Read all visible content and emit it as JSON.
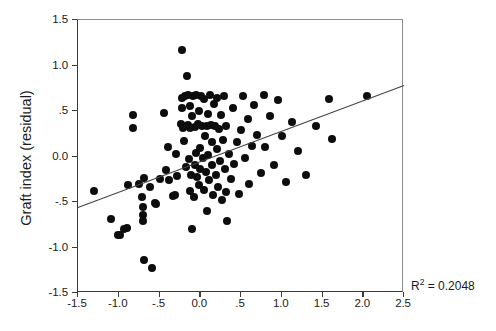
{
  "chart_data": {
    "type": "scatter",
    "title": "",
    "xlabel": "",
    "ylabel": "Graft index (residual)",
    "xlim": [
      -1.5,
      2.5
    ],
    "ylim": [
      -1.5,
      1.5
    ],
    "grid": false,
    "legend": null,
    "xticks": [
      -1.5,
      -1.0,
      -0.5,
      0.0,
      0.5,
      1.0,
      1.5,
      2.0,
      2.5
    ],
    "xticklabels": [
      "-1.5",
      "-1.0",
      "-.5",
      "0.0",
      ".5",
      "1.0",
      "1.5",
      "2.0",
      "2.5"
    ],
    "yticks": [
      -1.5,
      -1.0,
      -0.5,
      0.0,
      0.5,
      1.0,
      1.5
    ],
    "yticklabels": [
      "-1.5",
      "-1.0",
      "-.5",
      "0.0",
      ".5",
      "1.0",
      "1.5"
    ],
    "annotations": [
      {
        "name": "r-squared",
        "text": "R2 = 0.2048",
        "value": 0.2048,
        "position": "bottom-right-outside"
      }
    ],
    "fit_line": {
      "kind": "linear-regression",
      "x0": -1.5,
      "y0": -0.56,
      "x1": 2.5,
      "y1": 0.78,
      "slope": 0.335,
      "intercept": -0.0575,
      "r_squared": 0.2048,
      "color": "#444444"
    },
    "marker": {
      "shape": "circle",
      "color": "#0d0d0d",
      "size_px": 8
    },
    "points": [
      [
        -1.3,
        -0.38
      ],
      [
        -1.1,
        -0.69
      ],
      [
        -1.01,
        -0.86
      ],
      [
        -0.99,
        -0.86
      ],
      [
        -0.93,
        -0.8
      ],
      [
        -0.9,
        -0.79
      ],
      [
        -0.89,
        -0.31
      ],
      [
        -0.83,
        0.46
      ],
      [
        -0.83,
        0.31
      ],
      [
        -0.75,
        -0.3
      ],
      [
        -0.72,
        -0.44
      ],
      [
        -0.7,
        -0.56
      ],
      [
        -0.7,
        -0.64
      ],
      [
        -0.7,
        -0.71
      ],
      [
        -0.69,
        -1.14
      ],
      [
        -0.69,
        -0.24
      ],
      [
        -0.62,
        -0.33
      ],
      [
        -0.59,
        -1.22
      ],
      [
        -0.55,
        -0.51
      ],
      [
        -0.54,
        -0.52
      ],
      [
        -0.49,
        -0.25
      ],
      [
        -0.45,
        0.48
      ],
      [
        -0.42,
        -0.15
      ],
      [
        -0.4,
        0.1
      ],
      [
        -0.38,
        -0.26
      ],
      [
        -0.33,
        -0.43
      ],
      [
        -0.31,
        -0.42
      ],
      [
        -0.3,
        0.03
      ],
      [
        -0.28,
        -0.21
      ],
      [
        -0.24,
        0.36
      ],
      [
        -0.23,
        1.17
      ],
      [
        -0.22,
        0.64
      ],
      [
        -0.22,
        0.53
      ],
      [
        -0.21,
        0.31
      ],
      [
        -0.2,
        0.17
      ],
      [
        -0.19,
        0.67
      ],
      [
        -0.18,
        0.33
      ],
      [
        -0.17,
        -0.12
      ],
      [
        -0.16,
        0.88
      ],
      [
        -0.15,
        0.68
      ],
      [
        -0.15,
        0.35
      ],
      [
        -0.14,
        -0.03
      ],
      [
        -0.13,
        0.55
      ],
      [
        -0.13,
        -0.38
      ],
      [
        -0.12,
        0.31
      ],
      [
        -0.11,
        -0.2
      ],
      [
        -0.1,
        -0.8
      ],
      [
        -0.1,
        0.44
      ],
      [
        -0.09,
        0.66
      ],
      [
        -0.08,
        -0.45
      ],
      [
        -0.07,
        0.32
      ],
      [
        -0.06,
        -0.09
      ],
      [
        -0.05,
        0.68
      ],
      [
        -0.05,
        0.04
      ],
      [
        -0.04,
        -0.22
      ],
      [
        -0.03,
        0.36
      ],
      [
        -0.02,
        -0.31
      ],
      [
        -0.01,
        0.5
      ],
      [
        0.0,
        0.09
      ],
      [
        0.0,
        -0.14
      ],
      [
        0.01,
        0.67
      ],
      [
        0.02,
        0.34
      ],
      [
        0.03,
        -0.02
      ],
      [
        0.04,
        -0.37
      ],
      [
        0.05,
        0.63
      ],
      [
        0.06,
        0.22
      ],
      [
        0.07,
        -0.17
      ],
      [
        0.08,
        0.34
      ],
      [
        0.08,
        -0.6
      ],
      [
        0.09,
        0.47
      ],
      [
        0.1,
        0.02
      ],
      [
        0.11,
        -0.26
      ],
      [
        0.12,
        0.68
      ],
      [
        0.13,
        0.35
      ],
      [
        0.14,
        -0.09
      ],
      [
        0.15,
        0.16
      ],
      [
        0.16,
        -0.42
      ],
      [
        0.17,
        0.58
      ],
      [
        0.18,
        0.34
      ],
      [
        0.19,
        -0.2
      ],
      [
        0.2,
        0.08
      ],
      [
        0.21,
        0.64
      ],
      [
        0.22,
        -0.33
      ],
      [
        0.23,
        0.3
      ],
      [
        0.24,
        -0.05
      ],
      [
        0.26,
        0.46
      ],
      [
        0.27,
        -0.48
      ],
      [
        0.28,
        0.18
      ],
      [
        0.29,
        0.67
      ],
      [
        0.3,
        -0.14
      ],
      [
        0.31,
        -0.39
      ],
      [
        0.32,
        0.34
      ],
      [
        0.33,
        -0.71
      ],
      [
        0.35,
        0.03
      ],
      [
        0.38,
        -0.25
      ],
      [
        0.4,
        0.53
      ],
      [
        0.42,
        -0.08
      ],
      [
        0.45,
        0.16
      ],
      [
        0.47,
        -0.41
      ],
      [
        0.5,
        0.29
      ],
      [
        0.52,
        0.66
      ],
      [
        0.55,
        -0.02
      ],
      [
        0.58,
        0.41
      ],
      [
        0.6,
        -0.3
      ],
      [
        0.63,
        0.12
      ],
      [
        0.66,
        0.57
      ],
      [
        0.7,
        0.24
      ],
      [
        0.74,
        -0.18
      ],
      [
        0.78,
        0.68
      ],
      [
        0.8,
        0.1
      ],
      [
        0.86,
        0.45
      ],
      [
        0.9,
        -0.09
      ],
      [
        0.95,
        0.62
      ],
      [
        1.0,
        0.22
      ],
      [
        1.05,
        -0.28
      ],
      [
        1.12,
        0.38
      ],
      [
        1.2,
        0.06
      ],
      [
        1.3,
        -0.2
      ],
      [
        1.42,
        0.33
      ],
      [
        1.58,
        0.63
      ],
      [
        1.62,
        0.19
      ],
      [
        2.05,
        0.66
      ]
    ]
  }
}
